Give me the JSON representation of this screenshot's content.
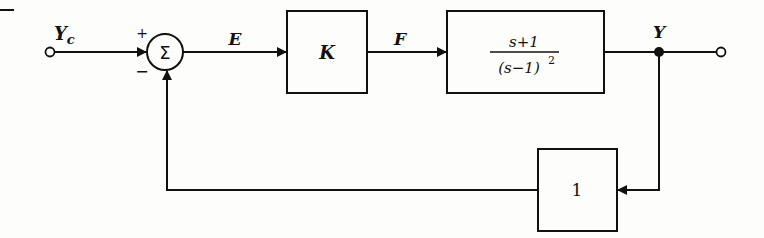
{
  "diagram": {
    "type": "feedback-control-block-diagram",
    "input_label": "Y",
    "input_subscript": "c",
    "sum_symbol": "Σ",
    "sum_plus": "+",
    "sum_minus": "−",
    "error_label": "E",
    "controller_label": "K",
    "control_signal_label": "F",
    "plant": {
      "numerator": "s+1",
      "denominator": "(s−1)",
      "denominator_exponent": "2"
    },
    "output_label": "Y",
    "feedback_gain": "1"
  },
  "colors": {
    "line": "#111111",
    "background": "#fdfdfb"
  }
}
